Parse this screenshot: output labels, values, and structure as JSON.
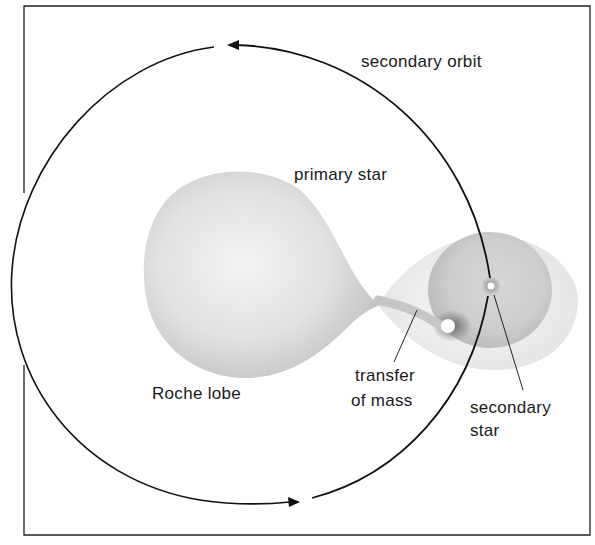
{
  "diagram": {
    "labels": {
      "secondary_orbit": "secondary orbit",
      "primary_star": "primary star",
      "roche_lobe": "Roche lobe",
      "transfer_line1": "transfer",
      "transfer_line2": "of mass",
      "secondary_line1": "secondary",
      "secondary_line2": "star"
    },
    "colors": {
      "line": "#111111",
      "lobe_fill": "#dcdcdc",
      "disc_fill": "#c9c9c9",
      "halo_fill": "#ececec",
      "background": "#ffffff"
    }
  }
}
